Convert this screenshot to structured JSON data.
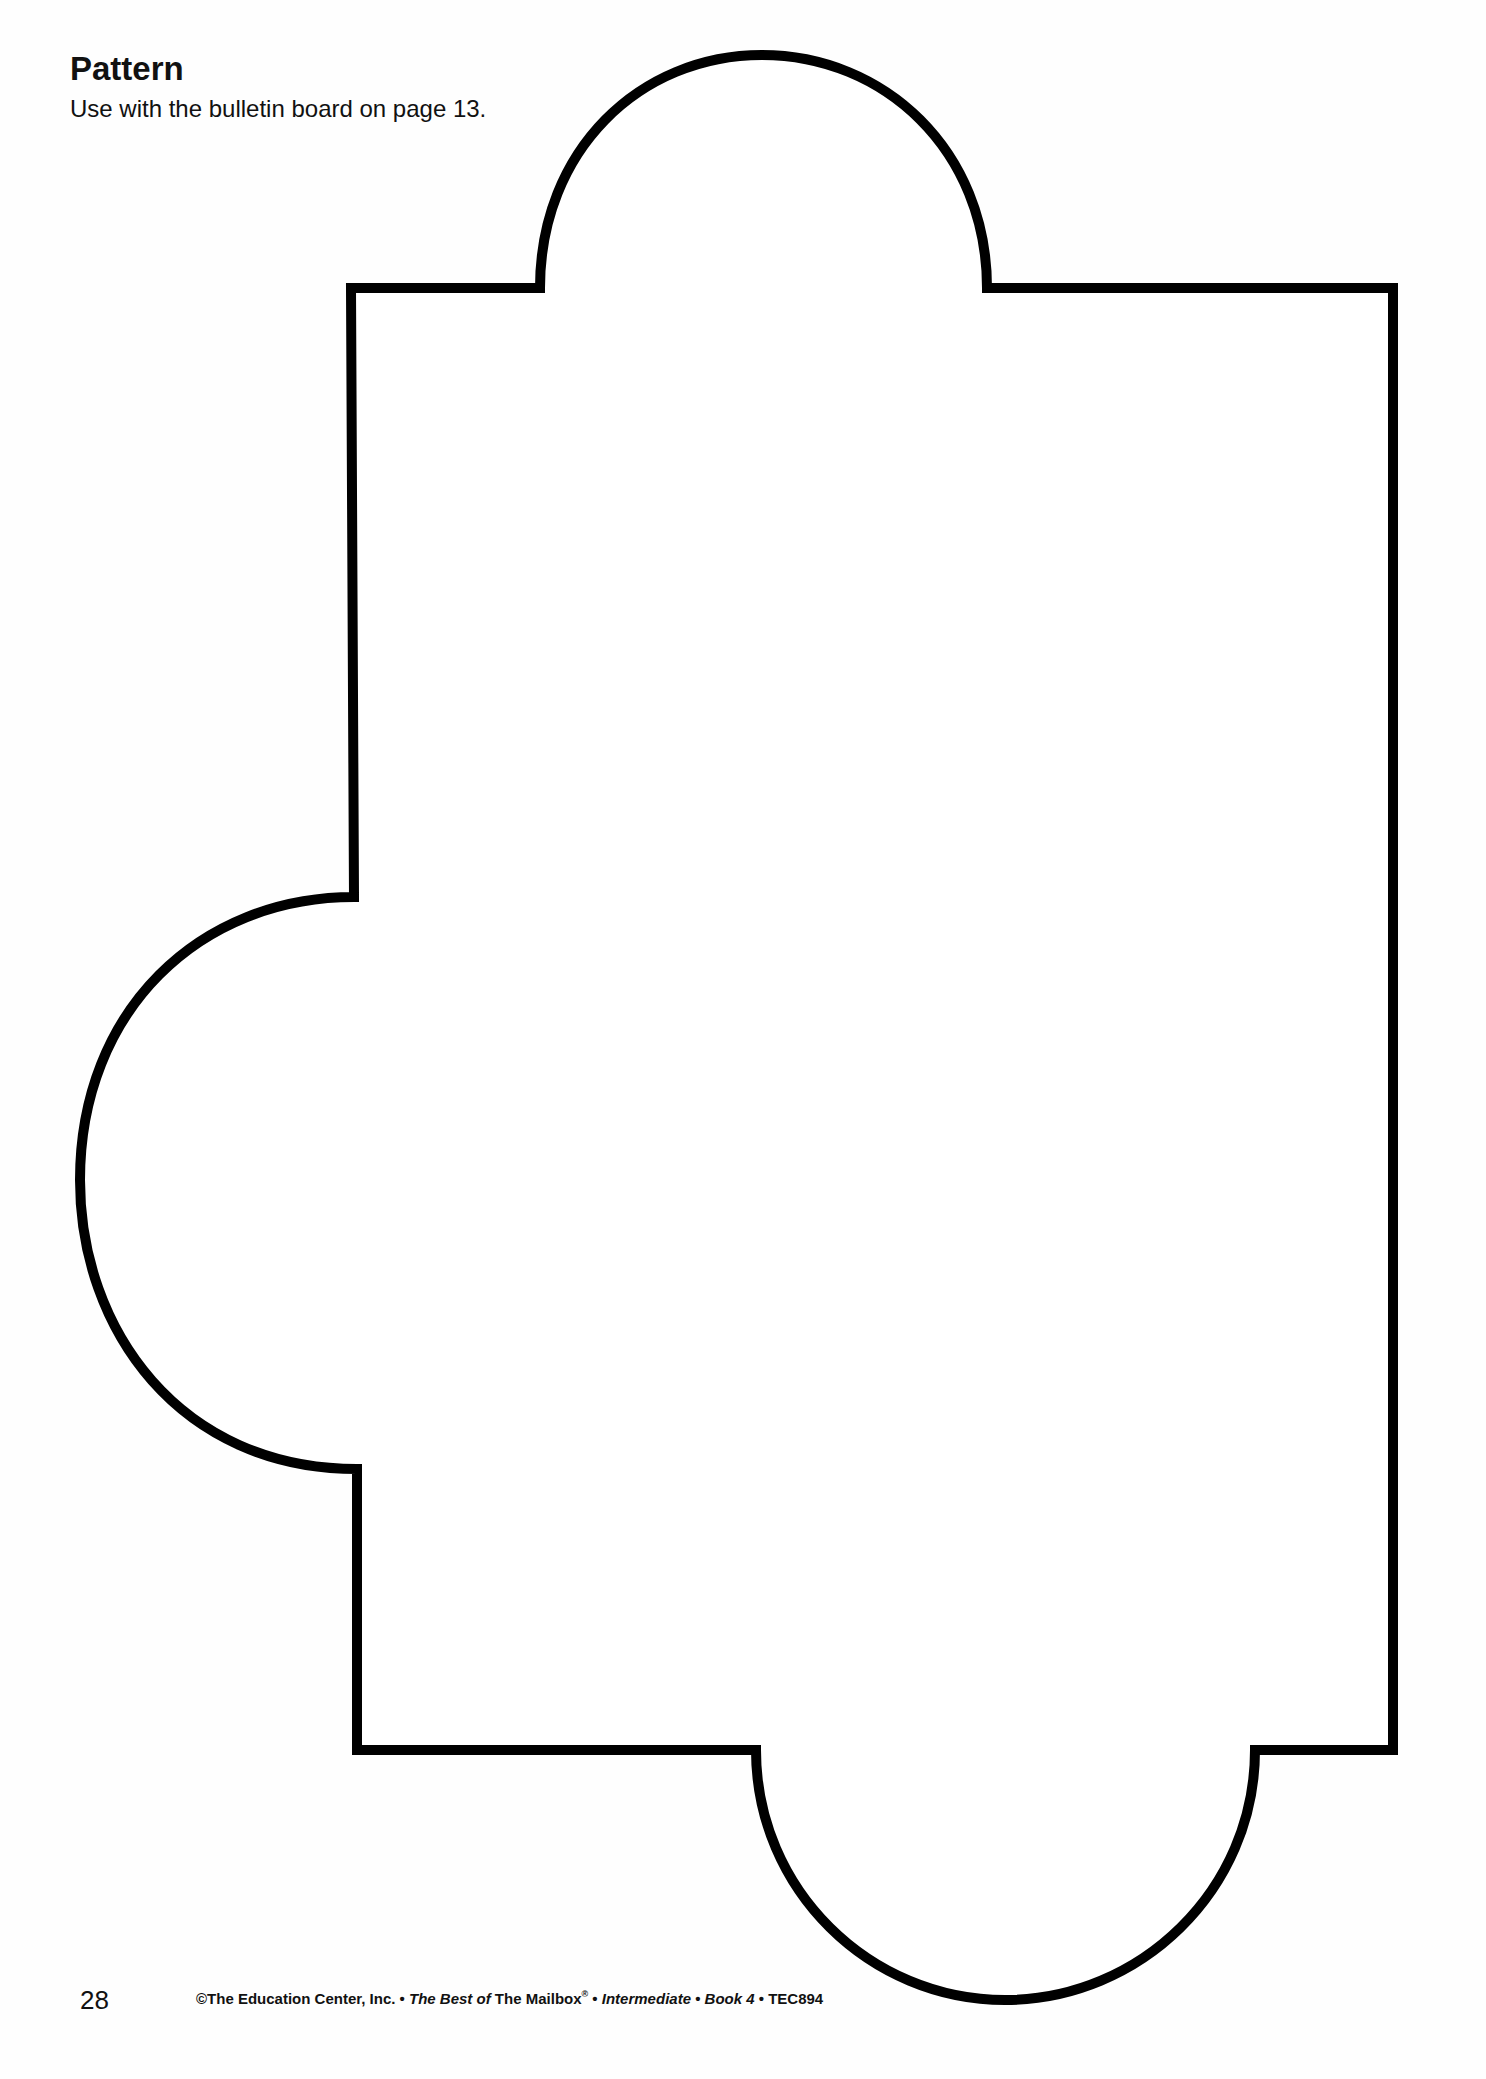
{
  "header": {
    "title": "Pattern",
    "subtitle": "Use with the bulletin board on page 13."
  },
  "pattern_shape": {
    "description": "Rectangle outline with semicircular tabs on top, left and bottom edges",
    "stroke_color": "#000000",
    "fill_color": "#ffffff"
  },
  "footer": {
    "page_number": "28",
    "credit": {
      "copyright": "©The Education Center, Inc.",
      "sep": " • ",
      "best_of": "The Best of",
      "mailbox": " The Mailbox",
      "registered": "®",
      "level": "Intermediate",
      "book": "Book 4",
      "code": "TEC894"
    }
  }
}
